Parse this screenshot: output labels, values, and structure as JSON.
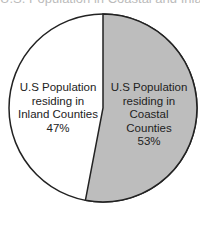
{
  "chart_data": {
    "type": "pie",
    "title": "U.S. Population in Coastal and Inland Counties",
    "slices": [
      {
        "label": "U.S Population residing in Coastal Counties",
        "value": 53,
        "color": "#bdbdbd"
      },
      {
        "label": "U.S Population residing in Inland Counties",
        "value": 47,
        "color": "#ffffff"
      }
    ],
    "start_angle": "top (12 o'clock)",
    "direction": "clockwise",
    "legend": "none (labels inside slices)"
  },
  "labels": {
    "inland": {
      "l1": "U.S Population",
      "l2": "residing in",
      "l3": "Inland Counties",
      "pct": "47%"
    },
    "coastal": {
      "l1": "U.S Population",
      "l2": "residing in",
      "l3": "Coastal",
      "l4": "Counties",
      "pct": "53%"
    }
  },
  "title_text": "U.S. Population in Coastal and Inland Counties"
}
